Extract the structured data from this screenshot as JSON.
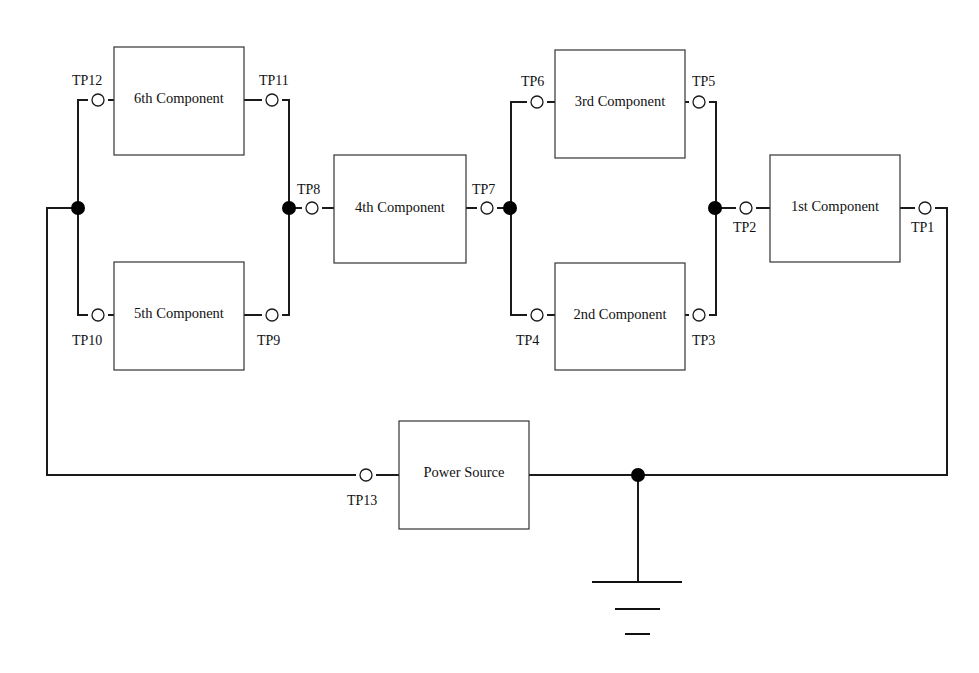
{
  "diagram": {
    "type": "circuit-schematic",
    "components": [
      {
        "id": "c6",
        "label": "6th Component"
      },
      {
        "id": "c5",
        "label": "5th Component"
      },
      {
        "id": "c4",
        "label": "4th Component"
      },
      {
        "id": "c3",
        "label": "3rd Component"
      },
      {
        "id": "c2",
        "label": "2nd Component"
      },
      {
        "id": "c1",
        "label": "1st Component"
      },
      {
        "id": "ps",
        "label": "Power Source"
      }
    ],
    "test_points": {
      "tp1": "TP1",
      "tp2": "TP2",
      "tp3": "TP3",
      "tp4": "TP4",
      "tp5": "TP5",
      "tp6": "TP6",
      "tp7": "TP7",
      "tp8": "TP8",
      "tp9": "TP9",
      "tp10": "TP10",
      "tp11": "TP11",
      "tp12": "TP12",
      "tp13": "TP13"
    },
    "ground_symbol": "ground",
    "colors": {
      "wire": "#1a1a1a",
      "box": "#333333",
      "junction": "#000000",
      "background": "#ffffff"
    }
  }
}
